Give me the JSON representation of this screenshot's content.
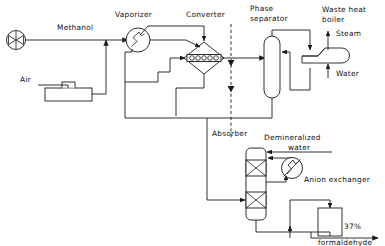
{
  "diagram": {
    "labels": {
      "methanol": "Methanol",
      "air": "Air",
      "vaporizer": "Vaporizer",
      "converter": "Converter",
      "phase_separator_l1": "Phase",
      "phase_separator_l2": "separator",
      "waste_heat_boiler_l1": "Waste heat",
      "waste_heat_boiler_l2": "boiler",
      "steam": "Steam",
      "water": "Water",
      "absorber": "Absorber",
      "demineralized_l1": "Demineralized",
      "demineralized_l2": "water",
      "anion_exchanger": "Anion exchanger",
      "product_pct": "37%",
      "product_name": "formaldehyde"
    },
    "equipment": [
      {
        "id": "methanol-pump",
        "name": "Methanol feed pump",
        "symbol": "circle-with-bowtie"
      },
      {
        "id": "air-blower",
        "name": "Air blower / filter",
        "symbol": "rect-with-stub"
      },
      {
        "id": "vaporizer",
        "name": "Vaporizer",
        "symbol": "circle-with-zigzag"
      },
      {
        "id": "converter",
        "name": "Converter",
        "symbol": "diamond-with-catalyst-bed"
      },
      {
        "id": "phase-separator",
        "name": "Phase separator",
        "symbol": "vertical-column-rounded"
      },
      {
        "id": "waste-heat-boiler",
        "name": "Waste heat boiler",
        "symbol": "horizontal-vessel"
      },
      {
        "id": "absorber",
        "name": "Absorber",
        "symbol": "packed-column-two-beds"
      },
      {
        "id": "product-cooler",
        "name": "Product cooler",
        "symbol": "circle-with-zigzag-slash"
      },
      {
        "id": "anion-exchanger",
        "name": "Anion exchanger",
        "symbol": "vertical-rectangle"
      }
    ],
    "streams": [
      {
        "id": "methanol-feed",
        "label": "Methanol"
      },
      {
        "id": "air-feed",
        "label": "Air"
      },
      {
        "id": "steam-out",
        "label": "Steam"
      },
      {
        "id": "water-in",
        "label": "Water"
      },
      {
        "id": "demin-water-in",
        "label": "Demineralized water"
      },
      {
        "id": "product-out",
        "label": "37% formaldehyde"
      }
    ],
    "colors": {
      "line": "#1a1a1a",
      "background": "#ffffff",
      "text": "#111111"
    }
  }
}
